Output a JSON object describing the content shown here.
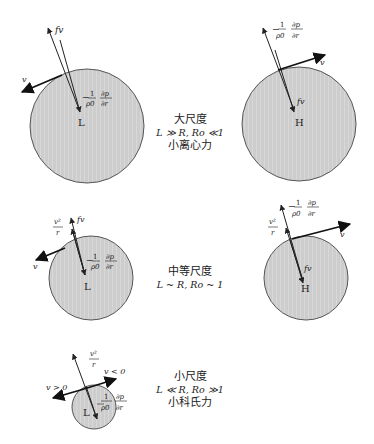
{
  "colors": {
    "circle_fill": "#cfcfcf",
    "circle_stroke": "#555555",
    "arrow": "#222222",
    "background": "#ffffff"
  },
  "panels": [
    {
      "name": "large-scale",
      "label_cn": "大尺度",
      "condition": "L ≫ R, Ro ≪1",
      "note_cn": "小离心力",
      "left": {
        "center": "L",
        "forces": [
          "fv",
          "-1/ρ0 ∂p/∂r"
        ],
        "velocity": "v"
      },
      "right": {
        "center": "H",
        "forces": [
          "-1/ρ0 ∂p/∂r",
          "fv"
        ],
        "velocity": "v"
      }
    },
    {
      "name": "medium-scale",
      "label_cn": "中等尺度",
      "condition": "L ~ R, Ro ~ 1",
      "left": {
        "center": "L",
        "forces": [
          "fv",
          "v²/r",
          "-1/ρ0 ∂p/∂r"
        ],
        "velocity": "v"
      },
      "right": {
        "center": "H",
        "forces": [
          "-1/ρ0 ∂p/∂r",
          "v²/r",
          "fv"
        ],
        "velocity": "v"
      }
    },
    {
      "name": "small-scale",
      "label_cn": "小尺度",
      "condition": "L ≪ R, Ro ≫1",
      "note_cn": "小科氏力",
      "left": {
        "center": "L",
        "forces": [
          "v²/r",
          "-1/ρ0 ∂p/∂r"
        ],
        "velocity_pos": "v > 0",
        "velocity_neg": "v < 0"
      }
    }
  ],
  "symbols": {
    "fv": "fv",
    "v": "v",
    "L": "L",
    "H": "H",
    "neg": "−",
    "one": "1",
    "rho0": "ρ0",
    "dp": "∂p",
    "dr": "∂r",
    "v2": "v²",
    "r": "r",
    "vpos": "v > 0",
    "vneg": "v < 0"
  }
}
